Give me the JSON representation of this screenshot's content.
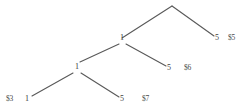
{
  "diagram": {
    "type": "binary-tree-ladder",
    "background_color": "#ffffff",
    "line_color": "#595959",
    "text_color": "#3f3f3f",
    "nodes": [
      {
        "id": "root",
        "label": "",
        "x": 172,
        "y": 6
      },
      {
        "id": "n1",
        "label": "1",
        "x": 122,
        "y": 38
      },
      {
        "id": "n2",
        "label": "1",
        "x": 77,
        "y": 67
      },
      {
        "id": "n3",
        "label": "1",
        "x": 27,
        "y": 99
      }
    ],
    "leaves": [
      {
        "id": "l5",
        "label": "5",
        "x": 218,
        "y": 38
      },
      {
        "id": "l6",
        "label": "5",
        "x": 170,
        "y": 68
      },
      {
        "id": "l7",
        "label": "5",
        "x": 123,
        "y": 99
      }
    ],
    "annotations": [
      {
        "id": "a5",
        "label": "$5",
        "x": 232,
        "y": 38
      },
      {
        "id": "a6",
        "label": "$6",
        "x": 188,
        "y": 68
      },
      {
        "id": "a7",
        "label": "$7",
        "x": 146,
        "y": 99
      },
      {
        "id": "a3",
        "label": "$3",
        "x": 10,
        "y": 99
      }
    ],
    "edges": [
      {
        "id": "root-to-n1",
        "from": [
          172,
          6
        ],
        "to": [
          122,
          38
        ]
      },
      {
        "id": "root-to-l5",
        "from": [
          172,
          6
        ],
        "to": [
          214,
          36
        ]
      },
      {
        "id": "n1-to-n2",
        "from": [
          119,
          44
        ],
        "to": [
          80,
          62
        ]
      },
      {
        "id": "n1-to-l6",
        "from": [
          126,
          44
        ],
        "to": [
          166,
          66
        ]
      },
      {
        "id": "n2-to-n3",
        "from": [
          73,
          73
        ],
        "to": [
          32,
          96
        ]
      },
      {
        "id": "n2-to-l7",
        "from": [
          81,
          73
        ],
        "to": [
          119,
          97
        ]
      }
    ]
  }
}
